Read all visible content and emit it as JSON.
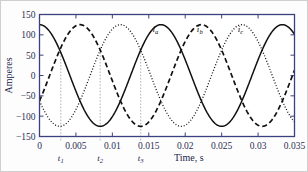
{
  "chart_data": {
    "type": "line",
    "title": "",
    "xlabel": "Time, s",
    "ylabel": "Amperes",
    "xlim": [
      0,
      0.035
    ],
    "ylim": [
      -150,
      150
    ],
    "xticks": [
      0,
      0.005,
      0.01,
      0.015,
      0.02,
      0.025,
      0.03,
      0.035
    ],
    "xticklabels": [
      "0",
      "0.005",
      "0.01",
      "0.015",
      "0.02",
      "0.025",
      "0.03",
      "0.035"
    ],
    "yticks": [
      -150,
      -100,
      -50,
      0,
      50,
      100,
      150
    ],
    "yticklabels": [
      "−150",
      "−100",
      "−50",
      "0",
      "50",
      "100",
      "150"
    ],
    "grid": false,
    "legend_position": "inline-annotations",
    "amplitude": 125,
    "frequency_hz": 60,
    "period_s": 0.016667,
    "series": [
      {
        "name": "i_a",
        "label": "i",
        "subscript": "a",
        "linestyle": "solid",
        "color": "#111111",
        "phase_deg": 0,
        "label_x": 0.0155,
        "label_y": 108
      },
      {
        "name": "i_b",
        "label": "i",
        "subscript": "b",
        "linestyle": "dashed",
        "color": "#111111",
        "phase_deg": -120,
        "label_x": 0.0216,
        "label_y": 108
      },
      {
        "name": "i_c",
        "label": "i",
        "subscript": "c",
        "linestyle": "dotted",
        "color": "#111111",
        "phase_deg": -240,
        "label_x": 0.0272,
        "label_y": 108
      }
    ],
    "markers": [
      {
        "name": "t1",
        "label": "t",
        "subscript": "1",
        "x": 0.00292,
        "y_top": 57
      },
      {
        "name": "t2",
        "label": "t",
        "subscript": "2",
        "x": 0.00833,
        "y_top": 57
      },
      {
        "name": "t3",
        "label": "t",
        "subscript": "3",
        "x": 0.01389,
        "y_top": 57
      }
    ],
    "colors": {
      "frame": "#3a4080",
      "tick_text": "#2b2f52",
      "curve": "#111111",
      "marker_line": "#a9a9b8",
      "plot_background": "#ffffff",
      "figure_background": "#fdfdfd"
    }
  }
}
